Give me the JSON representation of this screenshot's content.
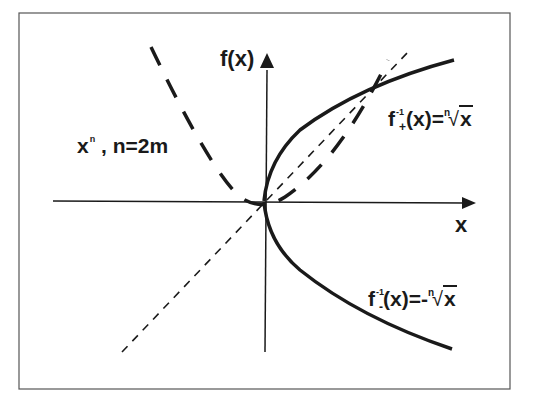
{
  "figure": {
    "y_axis_label": "f(x)",
    "x_axis_label": "x",
    "curve_label_power": {
      "base": "x",
      "exponent": "n",
      "condition": ", n=2m"
    },
    "curve_label_plus": {
      "f": "f",
      "sub": "+",
      "sup": "-1",
      "args": "(x)=",
      "neg": "",
      "index": "n",
      "radicand": "x"
    },
    "curve_label_minus": {
      "f": "f",
      "sub": "-",
      "sup": "-1",
      "args": "(x)=",
      "neg": "-",
      "index": "n",
      "radicand": "x"
    },
    "colors": {
      "ink": "#1a1a1a",
      "frame": "#555555",
      "background": "#ffffff"
    }
  }
}
